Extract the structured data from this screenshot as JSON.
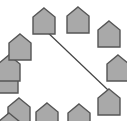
{
  "figure": {
    "title": "",
    "width": 127,
    "height": 121,
    "background_color": "#ffffff"
  },
  "style": {
    "node_fill": "#a9a9a9",
    "node_stroke": "#555555",
    "node_stroke_width": 1.4,
    "edge_stroke": "#444444",
    "edge_stroke_width": 1.2
  },
  "diagram": {
    "type": "node-link",
    "layout": "circular",
    "node_shape": "house-pentagon",
    "node_count": 12,
    "edge_count": 1,
    "nodes": [
      {
        "id": "n1",
        "label": "",
        "x": 44,
        "y": 8,
        "w": 22,
        "h": 26,
        "roof": 9
      },
      {
        "id": "n2",
        "label": "",
        "x": 78,
        "y": 7,
        "w": 22,
        "h": 26,
        "roof": 9
      },
      {
        "id": "n3",
        "label": "",
        "x": 109,
        "y": 21,
        "w": 22,
        "h": 26,
        "roof": 9
      },
      {
        "id": "n4",
        "label": "",
        "x": 118,
        "y": 55,
        "w": 22,
        "h": 26,
        "roof": 9
      },
      {
        "id": "n5",
        "label": "",
        "x": 109,
        "y": 89,
        "w": 22,
        "h": 26,
        "roof": 9
      },
      {
        "id": "n6",
        "label": "",
        "x": 79,
        "y": 104,
        "w": 22,
        "h": 26,
        "roof": 9
      },
      {
        "id": "n7",
        "label": "",
        "x": 47,
        "y": 103,
        "w": 22,
        "h": 26,
        "roof": 9
      },
      {
        "id": "n8",
        "label": "",
        "x": 19,
        "y": 98,
        "w": 22,
        "h": 26,
        "roof": 9
      },
      {
        "id": "n9",
        "label": "",
        "x": 7,
        "y": 67,
        "w": 22,
        "h": 26,
        "roof": 9
      },
      {
        "id": "n10",
        "label": "",
        "x": 9,
        "y": 55,
        "w": 22,
        "h": 26,
        "roof": 9
      },
      {
        "id": "n11",
        "label": "",
        "x": 20,
        "y": 34,
        "w": 22,
        "h": 26,
        "roof": 9
      },
      {
        "id": "n12",
        "label": "",
        "x": 9,
        "y": 113,
        "w": 22,
        "h": 26,
        "roof": 9
      }
    ],
    "edges": [
      {
        "id": "e1",
        "from": "n1",
        "to": "n5",
        "x1": 44,
        "y1": 29,
        "x2": 108,
        "y2": 90
      }
    ]
  }
}
